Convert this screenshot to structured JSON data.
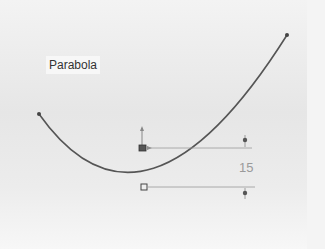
{
  "sketch": {
    "label": "Parabola",
    "dimension_value": "15",
    "curve_color": "#555555",
    "dim_line_color": "#888888"
  },
  "points": {
    "left_endpoint": [
      39,
      114
    ],
    "right_endpoint": [
      287,
      35
    ],
    "vertex": [
      144,
      187
    ],
    "focus_origin": [
      143,
      148
    ]
  }
}
